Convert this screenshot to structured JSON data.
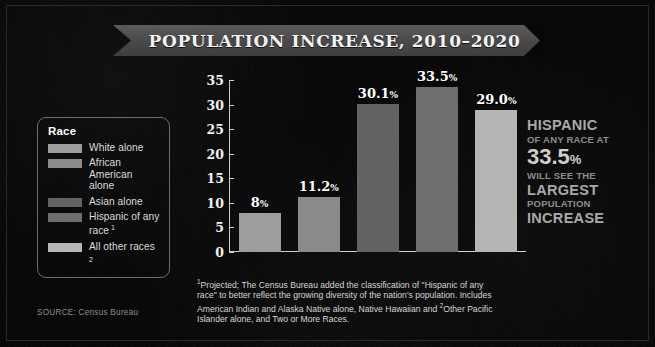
{
  "title": "POPULATION INCREASE, 2010–2020",
  "legend": {
    "heading": "Race",
    "items": [
      {
        "label": "White alone",
        "color": "#9d9d9d",
        "note": ""
      },
      {
        "label": "African American alone",
        "color": "#8a8a8a",
        "note": ""
      },
      {
        "label": "Asian alone",
        "color": "#636363",
        "note": ""
      },
      {
        "label": "Hispanic of any race",
        "color": "#6e6e6e",
        "note": "1"
      },
      {
        "label": "All other races",
        "color": "#b5b5b5",
        "note": "2"
      }
    ]
  },
  "callout": {
    "line1": "HISPANIC",
    "line2": "OF ANY RACE AT",
    "line3": "33.5",
    "line3_pct": "%",
    "line4": "WILL SEE THE",
    "line5": "LARGEST",
    "line6": "POPULATION",
    "line7": "INCREASE"
  },
  "footnote": "Projected; The Census Bureau added the classification of \"Hispanic of any race\" to better reflect the growing diversity of the nation's population. Includes American Indian and Alaska Native alone, Native Hawaiian and  Other Pacific Islander alone, and Two or More Races.",
  "footnote_marks": {
    "first": "1",
    "second": "2"
  },
  "source": "SOURCE: Census Bureau",
  "chart_data": {
    "type": "bar",
    "title": "POPULATION INCREASE, 2010–2020",
    "xlabel": "",
    "ylabel": "",
    "ylim": [
      0,
      35
    ],
    "yticks": [
      0,
      5,
      10,
      15,
      20,
      25,
      30,
      35
    ],
    "grid": false,
    "legend_position": "left",
    "categories": [
      "White alone",
      "African American alone",
      "Asian alone",
      "Hispanic of any race",
      "All other races"
    ],
    "values": [
      8,
      11.2,
      30.1,
      33.5,
      29.0
    ],
    "data_labels": [
      "8",
      "11.2",
      "30.1",
      "33.5",
      "29.0"
    ],
    "data_label_suffix": "%",
    "colors": [
      "#9d9d9d",
      "#8a8a8a",
      "#636363",
      "#6e6e6e",
      "#b5b5b5"
    ]
  }
}
